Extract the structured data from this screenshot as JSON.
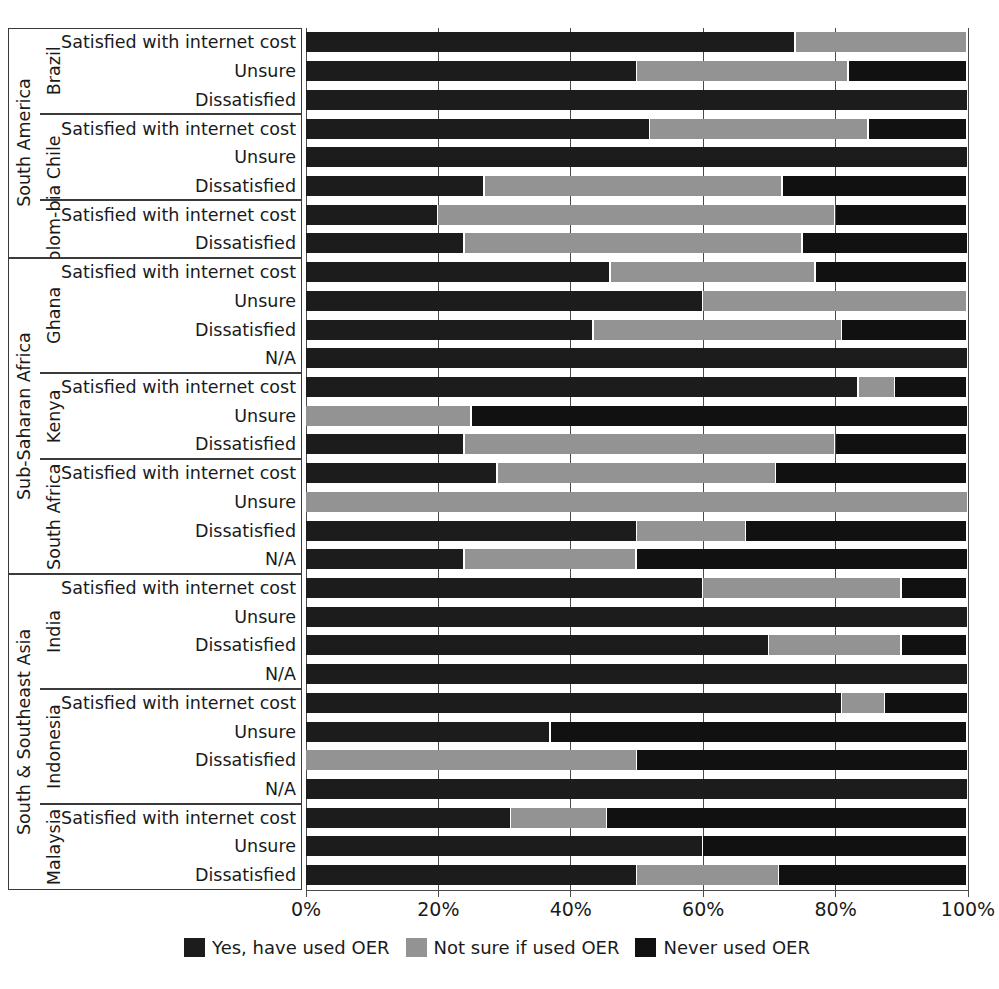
{
  "chart_data": {
    "type": "bar",
    "orientation": "horizontal",
    "stacked": true,
    "normalized": true,
    "title": "",
    "xlabel": "",
    "ylabel": "",
    "xlim": [
      0,
      100
    ],
    "xticks": [
      "0%",
      "20%",
      "40%",
      "60%",
      "80%",
      "100%"
    ],
    "xtick_values": [
      0,
      20,
      40,
      60,
      80,
      100
    ],
    "grid": "vertical",
    "legend_position": "bottom",
    "series": [
      {
        "name": "Yes, have used OER",
        "color": "#1c1c1c"
      },
      {
        "name": "Not sure if used OER",
        "color": "#939393"
      },
      {
        "name": "Never used OER",
        "color": "#111111"
      }
    ],
    "regions": [
      {
        "name": "South America",
        "countries": [
          {
            "name": "Brazil",
            "rows": [
              {
                "label": "Satisfied with internet cost",
                "values": [
                  74,
                  26,
                  0
                ]
              },
              {
                "label": "Unsure",
                "values": [
                  50,
                  32,
                  18
                ]
              },
              {
                "label": "Dissatisfied",
                "values": [
                  100,
                  0,
                  0
                ]
              }
            ]
          },
          {
            "name": "Chile",
            "rows": [
              {
                "label": "Satisfied with internet cost",
                "values": [
                  52,
                  33,
                  15
                ]
              },
              {
                "label": "Unsure",
                "values": [
                  100,
                  0,
                  0
                ]
              },
              {
                "label": "Dissatisfied",
                "values": [
                  27,
                  45,
                  28
                ]
              }
            ]
          },
          {
            "name": "Colom-\nbia",
            "rows": [
              {
                "label": "Satisfied with internet cost",
                "values": [
                  20,
                  60,
                  20
                ]
              },
              {
                "label": "Dissatisfied",
                "values": [
                  24,
                  51,
                  25
                ]
              }
            ]
          }
        ]
      },
      {
        "name": "Sub-Saharan Africa",
        "countries": [
          {
            "name": "Ghana",
            "rows": [
              {
                "label": "Satisfied with internet cost",
                "values": [
                  46,
                  31,
                  23
                ]
              },
              {
                "label": "Unsure",
                "values": [
                  60,
                  40,
                  0
                ]
              },
              {
                "label": "Dissatisfied",
                "values": [
                  43.5,
                  37.5,
                  19
                ]
              },
              {
                "label": "N/A",
                "values": [
                  100,
                  0,
                  0
                ]
              }
            ]
          },
          {
            "name": "Kenya",
            "rows": [
              {
                "label": "Satisfied with internet cost",
                "values": [
                  83.5,
                  5.5,
                  11
                ]
              },
              {
                "label": "Unsure",
                "values": [
                  0,
                  25,
                  75
                ]
              },
              {
                "label": "Dissatisfied",
                "values": [
                  24,
                  56,
                  20
                ]
              }
            ]
          },
          {
            "name": "South Africa",
            "rows": [
              {
                "label": "Satisfied with internet cost",
                "values": [
                  29,
                  42,
                  29
                ]
              },
              {
                "label": "Unsure",
                "values": [
                  0,
                  100,
                  0
                ]
              },
              {
                "label": "Dissatisfied",
                "values": [
                  50,
                  16.5,
                  33.5
                ]
              },
              {
                "label": "N/A",
                "values": [
                  24,
                  26,
                  50
                ]
              }
            ]
          }
        ]
      },
      {
        "name": "South & Southeast Asia",
        "countries": [
          {
            "name": "India",
            "rows": [
              {
                "label": "Satisfied with internet cost",
                "values": [
                  60,
                  30,
                  10
                ]
              },
              {
                "label": "Unsure",
                "values": [
                  100,
                  0,
                  0
                ]
              },
              {
                "label": "Dissatisfied",
                "values": [
                  70,
                  20,
                  10
                ]
              },
              {
                "label": "N/A",
                "values": [
                  100,
                  0,
                  0
                ]
              }
            ]
          },
          {
            "name": "Indonesia",
            "rows": [
              {
                "label": "Satisfied with internet cost",
                "values": [
                  81,
                  6.5,
                  12.5
                ]
              },
              {
                "label": "Unsure",
                "values": [
                  37,
                  0,
                  63
                ]
              },
              {
                "label": "Dissatisfied",
                "values": [
                  0,
                  50,
                  50
                ]
              },
              {
                "label": "N/A",
                "values": [
                  100,
                  0,
                  0
                ]
              }
            ]
          },
          {
            "name": "Malaysia",
            "rows": [
              {
                "label": "Satisfied with internet cost",
                "values": [
                  31,
                  14.5,
                  54.5
                ]
              },
              {
                "label": "Unsure",
                "values": [
                  60,
                  0,
                  40
                ]
              },
              {
                "label": "Dissatisfied",
                "values": [
                  50,
                  21.5,
                  28.5
                ]
              }
            ]
          }
        ]
      }
    ]
  },
  "legend": {
    "items": [
      {
        "label": "Yes, have used OER",
        "color": "#1c1c1c"
      },
      {
        "label": "Not sure if used OER",
        "color": "#939393"
      },
      {
        "label": "Never used OER",
        "color": "#111111"
      }
    ]
  }
}
